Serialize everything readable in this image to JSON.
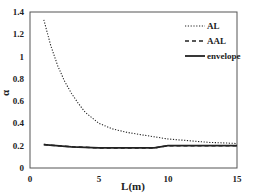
{
  "chart_data": {
    "type": "line",
    "title": "",
    "xlabel": "L(m)",
    "ylabel": "α",
    "xlim": [
      0,
      15
    ],
    "ylim": [
      0,
      1.4
    ],
    "x_ticks": [
      "0",
      "5",
      "10",
      "15"
    ],
    "y_ticks": [
      "0",
      "0.2",
      "0.4",
      "0.6",
      "0.8",
      "1",
      "1.2",
      "1.4"
    ],
    "grid": false,
    "legend_position": "upper right",
    "series": [
      {
        "name": "AL",
        "style": "dotted",
        "x": [
          1,
          1.5,
          2,
          2.5,
          3,
          3.5,
          4,
          5,
          6,
          7,
          8,
          9,
          10,
          11,
          12,
          13,
          14,
          15
        ],
        "y": [
          1.33,
          1.1,
          0.92,
          0.78,
          0.67,
          0.58,
          0.5,
          0.4,
          0.35,
          0.32,
          0.3,
          0.28,
          0.26,
          0.25,
          0.24,
          0.23,
          0.225,
          0.22
        ]
      },
      {
        "name": "AAL",
        "style": "dashed",
        "x": [
          1,
          3,
          5,
          7,
          9,
          10,
          12,
          15
        ],
        "y": [
          0.21,
          0.19,
          0.18,
          0.18,
          0.18,
          0.2,
          0.2,
          0.2
        ]
      },
      {
        "name": "envelope",
        "style": "solid",
        "x": [
          1,
          3,
          5,
          7,
          9,
          10,
          12,
          15
        ],
        "y": [
          0.21,
          0.19,
          0.18,
          0.18,
          0.18,
          0.2,
          0.2,
          0.2
        ]
      }
    ]
  }
}
